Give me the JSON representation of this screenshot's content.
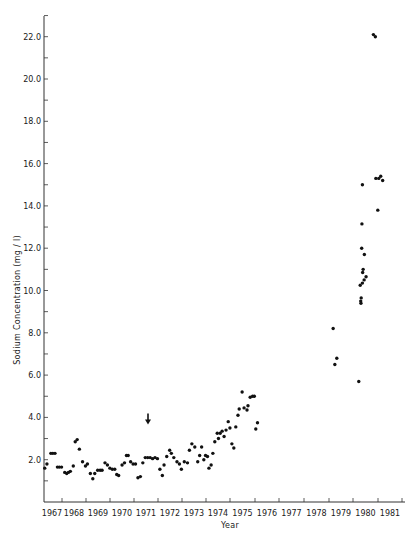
{
  "chart_data": {
    "type": "scatter",
    "title": "",
    "xlabel": "Year",
    "ylabel": "Sodium Concentration (mg / l)",
    "x_tick_labels": [
      "1967",
      "1968",
      "1969",
      "1970",
      "1971",
      "1972",
      "1973",
      "1974",
      "1975",
      "1976",
      "1977",
      "1978",
      "1979",
      "1980",
      "1981"
    ],
    "y_tick_labels": [
      "2.0",
      "4.0",
      "6.0",
      "8.0",
      "10.0",
      "12.0",
      "14.0",
      "16.0",
      "18.0",
      "20.0",
      "22.0"
    ],
    "ylim": [
      0,
      23
    ],
    "xlim": [
      1967.0,
      1982.0
    ],
    "grid": false,
    "legend": null,
    "annotations": [
      {
        "type": "arrow-down",
        "x": 1971.3,
        "y": 4.0,
        "note": "downward arrow marker"
      }
    ],
    "series": [
      {
        "name": "Sodium concentration",
        "points": [
          [
            1967.03,
            1.6
          ],
          [
            1967.12,
            1.8
          ],
          [
            1967.28,
            2.3
          ],
          [
            1967.36,
            2.3
          ],
          [
            1967.45,
            2.3
          ],
          [
            1967.55,
            1.65
          ],
          [
            1967.63,
            1.65
          ],
          [
            1967.72,
            1.65
          ],
          [
            1967.85,
            1.4
          ],
          [
            1967.93,
            1.35
          ],
          [
            1968.0,
            1.4
          ],
          [
            1968.08,
            1.45
          ],
          [
            1968.2,
            1.7
          ],
          [
            1968.28,
            2.85
          ],
          [
            1968.36,
            2.95
          ],
          [
            1968.45,
            2.5
          ],
          [
            1968.58,
            1.9
          ],
          [
            1968.7,
            1.7
          ],
          [
            1968.78,
            1.8
          ],
          [
            1968.9,
            1.35
          ],
          [
            1969.0,
            1.1
          ],
          [
            1969.08,
            1.35
          ],
          [
            1969.2,
            1.5
          ],
          [
            1969.3,
            1.5
          ],
          [
            1969.38,
            1.5
          ],
          [
            1969.5,
            1.85
          ],
          [
            1969.6,
            1.75
          ],
          [
            1969.7,
            1.6
          ],
          [
            1969.8,
            1.55
          ],
          [
            1969.9,
            1.55
          ],
          [
            1969.98,
            1.3
          ],
          [
            1970.06,
            1.25
          ],
          [
            1970.2,
            1.75
          ],
          [
            1970.3,
            1.85
          ],
          [
            1970.38,
            2.2
          ],
          [
            1970.45,
            2.2
          ],
          [
            1970.55,
            1.9
          ],
          [
            1970.65,
            1.8
          ],
          [
            1970.75,
            1.8
          ],
          [
            1970.85,
            1.15
          ],
          [
            1970.95,
            1.2
          ],
          [
            1971.05,
            1.85
          ],
          [
            1971.15,
            2.1
          ],
          [
            1971.25,
            2.1
          ],
          [
            1971.35,
            2.1
          ],
          [
            1971.45,
            2.05
          ],
          [
            1971.55,
            2.1
          ],
          [
            1971.65,
            2.05
          ],
          [
            1971.75,
            1.55
          ],
          [
            1971.85,
            1.25
          ],
          [
            1971.92,
            1.75
          ],
          [
            1972.03,
            2.15
          ],
          [
            1972.15,
            2.45
          ],
          [
            1972.22,
            2.3
          ],
          [
            1972.32,
            2.1
          ],
          [
            1972.45,
            1.9
          ],
          [
            1972.55,
            1.8
          ],
          [
            1972.63,
            1.55
          ],
          [
            1972.75,
            1.9
          ],
          [
            1972.88,
            1.85
          ],
          [
            1972.96,
            2.45
          ],
          [
            1973.06,
            2.75
          ],
          [
            1973.18,
            2.6
          ],
          [
            1973.3,
            1.9
          ],
          [
            1973.38,
            2.2
          ],
          [
            1973.46,
            2.6
          ],
          [
            1973.55,
            2.0
          ],
          [
            1973.62,
            2.2
          ],
          [
            1973.7,
            2.15
          ],
          [
            1973.76,
            1.6
          ],
          [
            1973.85,
            1.75
          ],
          [
            1973.92,
            2.3
          ],
          [
            1974.0,
            2.85
          ],
          [
            1974.1,
            3.25
          ],
          [
            1974.15,
            3.0
          ],
          [
            1974.22,
            3.25
          ],
          [
            1974.3,
            3.35
          ],
          [
            1974.38,
            3.1
          ],
          [
            1974.46,
            3.4
          ],
          [
            1974.55,
            3.8
          ],
          [
            1974.62,
            3.5
          ],
          [
            1974.7,
            2.75
          ],
          [
            1974.78,
            2.55
          ],
          [
            1974.86,
            3.55
          ],
          [
            1974.95,
            4.1
          ],
          [
            1975.0,
            4.4
          ],
          [
            1975.12,
            5.2
          ],
          [
            1975.2,
            4.45
          ],
          [
            1975.32,
            4.35
          ],
          [
            1975.36,
            4.55
          ],
          [
            1975.45,
            4.95
          ],
          [
            1975.55,
            5.0
          ],
          [
            1975.62,
            5.0
          ],
          [
            1975.68,
            3.45
          ],
          [
            1975.75,
            3.75
          ],
          [
            1978.85,
            8.2
          ],
          [
            1978.92,
            6.5
          ],
          [
            1979.0,
            6.8
          ],
          [
            1979.9,
            5.7
          ],
          [
            1979.98,
            9.5
          ],
          [
            1979.99,
            9.4
          ],
          [
            1980.0,
            9.65
          ],
          [
            1979.96,
            10.25
          ],
          [
            1980.05,
            10.35
          ],
          [
            1980.12,
            10.5
          ],
          [
            1980.2,
            10.65
          ],
          [
            1980.08,
            11.0
          ],
          [
            1980.06,
            10.85
          ],
          [
            1980.13,
            11.7
          ],
          [
            1980.02,
            12.0
          ],
          [
            1980.03,
            13.15
          ],
          [
            1980.05,
            15.0
          ],
          [
            1980.6,
            15.3
          ],
          [
            1980.72,
            15.3
          ],
          [
            1980.8,
            15.4
          ],
          [
            1980.88,
            15.2
          ],
          [
            1980.68,
            13.8
          ],
          [
            1980.5,
            22.1
          ],
          [
            1980.58,
            22.0
          ]
        ]
      }
    ]
  },
  "colors": {
    "marker": "#111111",
    "axis": "#333333",
    "background": "#ffffff"
  }
}
